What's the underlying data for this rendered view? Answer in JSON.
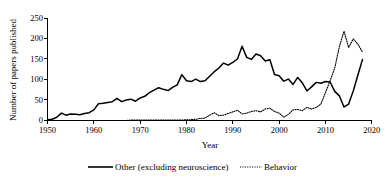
{
  "chart_data": {
    "type": "line",
    "title": "",
    "xlabel": "Year",
    "ylabel": "Number of papers published",
    "xlim": [
      1950,
      2020
    ],
    "ylim": [
      0,
      250
    ],
    "xticks": [
      1950,
      1960,
      1970,
      1980,
      1990,
      2000,
      2010,
      2020
    ],
    "yticks": [
      0,
      50,
      100,
      150,
      200,
      250
    ],
    "grid": false,
    "legend_position": "bottom",
    "x": [
      1950,
      1951,
      1952,
      1953,
      1954,
      1955,
      1956,
      1957,
      1958,
      1959,
      1960,
      1961,
      1962,
      1963,
      1964,
      1965,
      1966,
      1967,
      1968,
      1969,
      1970,
      1971,
      1972,
      1973,
      1974,
      1975,
      1976,
      1977,
      1978,
      1979,
      1980,
      1981,
      1982,
      1983,
      1984,
      1985,
      1986,
      1987,
      1988,
      1989,
      1990,
      1991,
      1992,
      1993,
      1994,
      1995,
      1996,
      1997,
      1998,
      1999,
      2000,
      2001,
      2002,
      2003,
      2004,
      2005,
      2006,
      2007,
      2008,
      2009,
      2010,
      2011,
      2012,
      2013,
      2014,
      2015,
      2016,
      2017,
      2018
    ],
    "series": [
      {
        "name": "Other (excluding neuroscience)",
        "style": "solid",
        "values": [
          2,
          3,
          8,
          18,
          13,
          16,
          15,
          14,
          17,
          19,
          26,
          41,
          42,
          44,
          46,
          54,
          46,
          50,
          52,
          47,
          55,
          59,
          68,
          74,
          80,
          76,
          73,
          81,
          87,
          112,
          97,
          95,
          101,
          95,
          97,
          108,
          119,
          128,
          140,
          135,
          142,
          150,
          181,
          154,
          149,
          162,
          158,
          145,
          148,
          112,
          109,
          96,
          101,
          88,
          105,
          92,
          72,
          82,
          93,
          91,
          95,
          94,
          71,
          60,
          33,
          40,
          72,
          111,
          149
        ]
      },
      {
        "name": "Behavior",
        "style": "dotted",
        "values": [
          0,
          0,
          0,
          0,
          0,
          0,
          0,
          0,
          0,
          0,
          0,
          0,
          0,
          0,
          0,
          0,
          0,
          0,
          1,
          1,
          1,
          1,
          1,
          1,
          1,
          1,
          1,
          1,
          1,
          1,
          2,
          2,
          3,
          5,
          6,
          13,
          19,
          12,
          13,
          17,
          21,
          25,
          16,
          18,
          22,
          24,
          21,
          28,
          30,
          22,
          18,
          8,
          15,
          26,
          27,
          24,
          32,
          28,
          32,
          40,
          68,
          97,
          128,
          180,
          218,
          178,
          199,
          186,
          167
        ]
      }
    ]
  },
  "legend": {
    "items": [
      {
        "label": "Other (excluding neuroscience)",
        "style": "solid"
      },
      {
        "label": "Behavior",
        "style": "dotted"
      }
    ]
  },
  "axes": {
    "y_title": "Number of papers published",
    "x_title": "Year",
    "ytick_labels": [
      "0",
      "50",
      "100",
      "150",
      "200",
      "250"
    ],
    "xtick_labels": [
      "1950",
      "1960",
      "1970",
      "1980",
      "1990",
      "2000",
      "2010",
      "2020"
    ]
  },
  "colors": {
    "line": "#000000",
    "axis": "#000000",
    "background": "#ffffff"
  }
}
